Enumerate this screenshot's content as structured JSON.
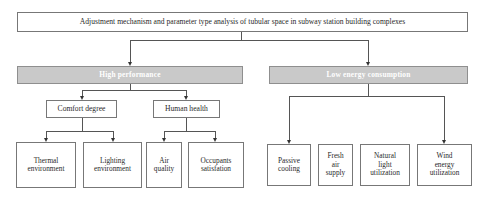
{
  "diagram": {
    "title": "Adjustment mechanism and parameter type analysis of tubular space in subway station building complexes",
    "colors": {
      "category_fill": "#c9c9c9",
      "category_text": "#ffffff",
      "box_border": "#777777",
      "connector": "#555555"
    },
    "categories": [
      {
        "label": "High performance",
        "subgroups": [
          {
            "label": "Comfort degree",
            "children": [
              "Thermal environment",
              "Lighting environment"
            ]
          },
          {
            "label": "Human health",
            "children": [
              "Air quality",
              "Occupants satisfation"
            ]
          }
        ]
      },
      {
        "label": "Low energy consumption",
        "children": [
          "Passive cooling",
          "Fresh air supply",
          "Natural light utilization",
          "Wind energy utilization"
        ]
      }
    ]
  },
  "labels": {
    "thermal": [
      "Thermal",
      "environment"
    ],
    "lighting": [
      "Lighting",
      "environment"
    ],
    "air": [
      "Air",
      "quality"
    ],
    "occupants": [
      "Occupants",
      "satisfation"
    ],
    "passive": [
      "Passive",
      "cooling"
    ],
    "fresh": [
      "Fresh",
      "air",
      "supply"
    ],
    "natural": [
      "Natural",
      "light",
      "utilization"
    ],
    "wind": [
      "Wind",
      "energy",
      "utilization"
    ]
  }
}
